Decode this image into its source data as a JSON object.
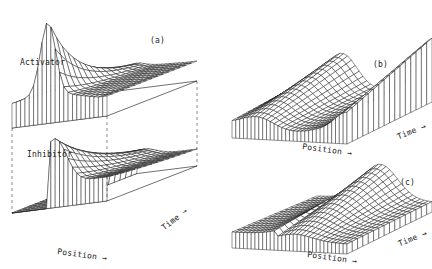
{
  "figure": {
    "panels": [
      {
        "id": "a",
        "label": "(a)",
        "sublabels": [
          "Activator",
          "Inhibitor"
        ],
        "x_axis": "Position →",
        "time_axis": "Time →"
      },
      {
        "id": "b",
        "label": "(b)",
        "x_axis": "Position →",
        "time_axis": "Time →"
      },
      {
        "id": "c",
        "label": "(c)",
        "x_axis": "Position →",
        "time_axis": "Time →"
      }
    ]
  },
  "chart_data": [
    {
      "type": "surface",
      "title": "(a) Activator",
      "xlabel": "Position",
      "ylabel": "Time",
      "description": "Sharp single peak of activator at one end that decays/spreads over time"
    },
    {
      "type": "surface",
      "title": "(a) Inhibitor",
      "xlabel": "Position",
      "ylabel": "Time",
      "description": "Broad ridge of inhibitor decaying along time axis"
    },
    {
      "type": "surface",
      "title": "(b)",
      "xlabel": "Position",
      "ylabel": "Time",
      "description": "Surface with peaks at both ends and a trough in the middle"
    },
    {
      "type": "surface",
      "title": "(c)",
      "xlabel": "Position",
      "ylabel": "Time",
      "description": "Surface with a single broad hump emerging in the middle over time"
    }
  ]
}
